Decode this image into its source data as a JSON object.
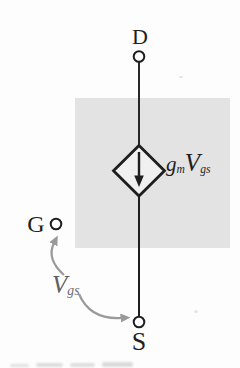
{
  "labels": {
    "drain": "D",
    "gate": "G",
    "source": "S",
    "gm_main": "g",
    "gm_sub": "m",
    "gm_v": "V",
    "gm_v_sub": "gs",
    "vgs_main": "V",
    "vgs_sub": "gs"
  },
  "colors": {
    "background": "#fdfdfd",
    "shaded_region": "#e3e3e3",
    "source_interior": "#f0f0f0",
    "line": "#1e1e1e",
    "annotation_arrow": "#9a9a9a",
    "vgs_label_text": "#5f5f5f"
  }
}
